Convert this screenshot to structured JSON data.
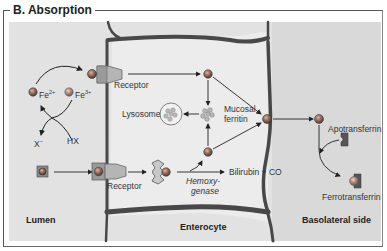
{
  "figure": {
    "title": "B. Absorption",
    "regions": {
      "lumen": "Lumen",
      "enterocyte": "Enterocyte",
      "basolateral": "Basolateral side"
    },
    "labels": {
      "fe2_base": "Fe",
      "fe2_sup": "2+",
      "fe3_base": "Fe",
      "fe3_sup": "3+",
      "x_minus": "X",
      "x_sup": "−",
      "hx": "HX",
      "receptor_top": "Receptor",
      "receptor_bottom": "Receptor",
      "lysosome": "Lysosome",
      "mucosal_ferritin_1": "Mucosal",
      "mucosal_ferritin_2": "ferritin",
      "hemoxygenase_1": "Hemoxy-",
      "hemoxygenase_2": "genase",
      "bilirubin_co": "Bilirubin + CO",
      "apotransferrin": "Apotransferrin",
      "ferrotransferrin": "Ferrotransferrin"
    },
    "colors": {
      "background_panel": "#e2e2e2",
      "membrane": "#4a4a4a",
      "iron_sphere": "#8a6a5a",
      "receptor": "#a8a8a8",
      "transferrin": "#555555",
      "text": "#333333"
    }
  }
}
